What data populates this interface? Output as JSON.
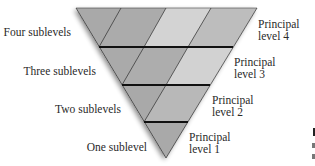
{
  "diagram": {
    "colors": {
      "dark": "#a9a9a9",
      "mid": "#b9b9b9",
      "light": "#d3d3d3",
      "line": "#1a1a1a"
    },
    "left_labels": [
      "Four sublevels",
      "Three sublevels",
      "Two sublevels",
      "One sublevel"
    ],
    "right_labels": [
      {
        "line1": "Principal",
        "line2": "level 4"
      },
      {
        "line1": "Principal",
        "line2": "level 3"
      },
      {
        "line1": "Principal",
        "line2": "level 2"
      },
      {
        "line1": "Principal",
        "line2": "level 1"
      }
    ],
    "rows": [
      {
        "level": 4,
        "sublevels": 4
      },
      {
        "level": 3,
        "sublevels": 3
      },
      {
        "level": 2,
        "sublevels": 2
      },
      {
        "level": 1,
        "sublevels": 1
      }
    ]
  }
}
